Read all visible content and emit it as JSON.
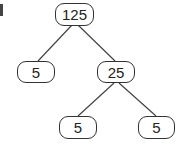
{
  "factor_tree": {
    "nodes": [
      {
        "id": "root",
        "value": "125"
      },
      {
        "id": "left",
        "value": "5"
      },
      {
        "id": "right",
        "value": "25"
      },
      {
        "id": "right-left",
        "value": "5"
      },
      {
        "id": "right-right",
        "value": "5"
      }
    ],
    "edges": [
      [
        "root",
        "left"
      ],
      [
        "root",
        "right"
      ],
      [
        "right",
        "right-left"
      ],
      [
        "right",
        "right-right"
      ]
    ]
  }
}
